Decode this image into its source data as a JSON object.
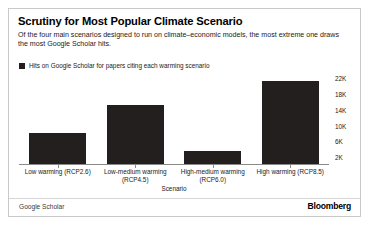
{
  "card": {
    "title": "Scrutiny for Most Popular Climate Scenario",
    "subtitle": "Of the four main scenarios designed to run on climate–economic models, the most extreme one draws the most Google Scholar hits.",
    "source_label": "Google Scholar",
    "brand": "Bloomberg",
    "accent_color": "#231f1e",
    "border_color": "#c9c9c9"
  },
  "legend": {
    "position": "top-left",
    "entries": [
      {
        "label": "Hits on Google Scholar for papers citing each warming scenario",
        "color": "#231f1e"
      }
    ]
  },
  "chart_data": {
    "type": "bar",
    "title": "Scrutiny for Most Popular Climate Scenario",
    "subtitle": "Of the four main scenarios designed to run on climate–economic models, the most extreme one draws the most Google Scholar hits.",
    "xlabel": "Scenario",
    "ylabel": "",
    "categories": [
      "Low warming (RCP2.6)",
      "Low-medium warming (RCP4.5)",
      "High-medium warming (RCP6.0)",
      "High warming (RCP8.5)"
    ],
    "category_lines": [
      [
        "Low warming (RCP2.6)"
      ],
      [
        "Low-medium warming",
        "(RCP4.5)"
      ],
      [
        "High-medium warming",
        "(RCP6.0)"
      ],
      [
        "High warming (RCP8.5)"
      ]
    ],
    "values": [
      7800,
      15000,
      3300,
      21000
    ],
    "value_labels": [
      "7.8K",
      "15K",
      "3.3K",
      "21K"
    ],
    "series": [
      {
        "name": "Hits on Google Scholar for papers citing each warming scenario",
        "color": "#231f1e",
        "values": [
          7800,
          15000,
          3300,
          21000
        ]
      }
    ],
    "ylim": [
      0,
      22800
    ],
    "yticks": [
      22000,
      18000,
      14000,
      10000,
      6000,
      2000
    ],
    "ytick_labels": [
      "22K",
      "18K",
      "14K",
      "10K",
      "6K",
      "2K"
    ],
    "grid": false,
    "axis_side": "right",
    "legend_position": "top-left",
    "source": "Google Scholar"
  }
}
